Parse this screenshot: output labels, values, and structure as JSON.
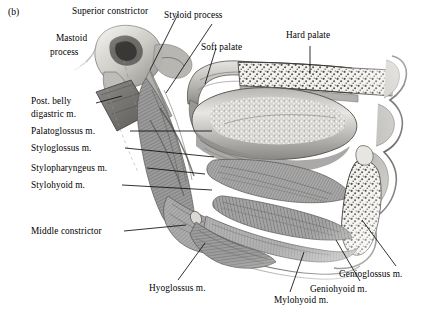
{
  "figure": {
    "panel_id": "(b)",
    "caption_subject": "sagittal section of oral cavity, tongue and pharyngeal muscles",
    "style": "grayscale halftone anatomical illustration",
    "background_color": "#ffffff",
    "ink_color": "#0d0d0d"
  },
  "labels": {
    "superior_constrictor": "Superior constrictor",
    "styloid_process": "Styloid process",
    "soft_palate": "Soft palate",
    "hard_palate": "Hard palate",
    "mastoid_process_line1": "Mastoid",
    "mastoid_process_line2": "process",
    "post_belly_digastric_line1": "Post. belly",
    "post_belly_digastric_line2": "digastric m.",
    "palatoglossus": "Palatoglossus m.",
    "styloglossus": "Styloglossus m.",
    "stylopharyngeus": "Stylopharyngeus m.",
    "stylohyoid": "Stylohyoid m.",
    "middle_constrictor": "Middle constrictor",
    "hyoglossus": "Hyoglossus m.",
    "mylohyoid": "Mylohyoid m.",
    "geniohyoid": "Geniohyoid m.",
    "genioglossus": "Genioglossus m."
  },
  "structures": [
    "temporal bone with mastoid process",
    "styloid process",
    "posterior belly of digastric muscle",
    "superior pharyngeal constrictor",
    "middle pharyngeal constrictor",
    "stylopharyngeus muscle",
    "stylohyoid muscle",
    "styloglossus muscle",
    "palatoglossus muscle",
    "soft palate",
    "hard palate with spongy bone",
    "tongue dorsum with papillae",
    "mandible with spongy bone",
    "genioglossus muscle",
    "geniohyoid muscle",
    "mylohyoid muscle",
    "hyoglossus muscle",
    "hyoid bone"
  ]
}
